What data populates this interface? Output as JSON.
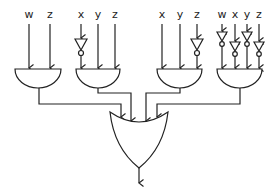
{
  "diagram": {
    "type": "logic-circuit",
    "gates": [
      {
        "id": "and1",
        "type": "AND",
        "inputs": [
          {
            "label": "w",
            "inverted": false
          },
          {
            "label": "z",
            "inverted": false
          }
        ]
      },
      {
        "id": "and2",
        "type": "AND",
        "inputs": [
          {
            "label": "x",
            "inverted": true
          },
          {
            "label": "y",
            "inverted": false
          },
          {
            "label": "z",
            "inverted": false
          }
        ]
      },
      {
        "id": "and3",
        "type": "AND",
        "inputs": [
          {
            "label": "x",
            "inverted": false
          },
          {
            "label": "y",
            "inverted": false
          },
          {
            "label": "z",
            "inverted": true
          }
        ]
      },
      {
        "id": "and4",
        "type": "AND",
        "inputs": [
          {
            "label": "w",
            "inverted": true
          },
          {
            "label": "x",
            "inverted": true
          },
          {
            "label": "y",
            "inverted": true
          },
          {
            "label": "z",
            "inverted": true
          }
        ]
      },
      {
        "id": "or1",
        "type": "OR",
        "inputs": [
          "and1",
          "and2",
          "and3",
          "and4"
        ]
      }
    ],
    "labels": {
      "g1": [
        "w",
        "z"
      ],
      "g2": [
        "x",
        "y",
        "z"
      ],
      "g3": [
        "x",
        "y",
        "z"
      ],
      "g4": [
        "w",
        "x",
        "y",
        "z"
      ]
    }
  }
}
